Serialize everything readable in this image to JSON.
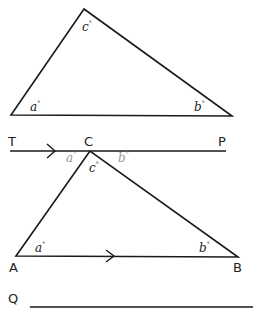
{
  "diagram": {
    "triangle_top": {
      "vertices": {
        "apex": [
          84,
          9
        ],
        "left": [
          11,
          115
        ],
        "right": [
          232,
          116
        ]
      },
      "angles": {
        "apex": "c",
        "left": "a",
        "right": "b"
      }
    },
    "parallel_line": {
      "start_label": "T",
      "end_label": "P",
      "mid_label": "C",
      "y": 151,
      "x_start": 10,
      "x_end": 226,
      "arrow_x": 55,
      "angles": {
        "left": "a",
        "below": "c",
        "right": "b"
      },
      "angle_color": "#9a9a9a"
    },
    "triangle_bottom": {
      "vertices": {
        "C": [
          90,
          151
        ],
        "A": [
          16,
          256
        ],
        "B": [
          238,
          257
        ]
      },
      "vertex_labels": {
        "A": "A",
        "B": "B"
      },
      "angles": {
        "A": "a",
        "B": "b"
      },
      "arrow_x": 113
    },
    "extra_line": {
      "label": "Q",
      "y": 307,
      "x_start": 30,
      "x_end": 253
    },
    "degree_symbol": "°",
    "line_color": "#1a1a1a"
  }
}
